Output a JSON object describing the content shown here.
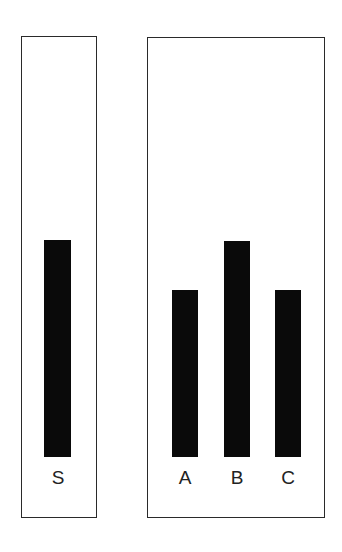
{
  "figure": {
    "standard_card": {
      "lines": [
        {
          "label": "S",
          "relative_length": 217
        }
      ]
    },
    "comparison_card": {
      "lines": [
        {
          "label": "A",
          "relative_length": 167
        },
        {
          "label": "B",
          "relative_length": 216
        },
        {
          "label": "C",
          "relative_length": 167
        }
      ]
    },
    "colors": {
      "bar": "#0a0a0a",
      "border": "#2a2a2a",
      "background": "#ffffff"
    }
  }
}
